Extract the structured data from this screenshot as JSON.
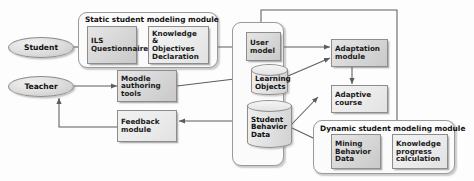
{
  "diagram": {
    "actors": [
      {
        "id": "student",
        "label": "Student"
      },
      {
        "id": "teacher",
        "label": "Teacher"
      }
    ],
    "groups": [
      {
        "id": "static-module",
        "title": "Static student modeling module"
      },
      {
        "id": "dynamic-module",
        "title": "Dynamic student modeling module"
      },
      {
        "id": "data-store-group",
        "title": ""
      }
    ],
    "boxes": [
      {
        "id": "ils-questionnaire",
        "lines": [
          "ILS",
          "Questionnaire"
        ]
      },
      {
        "id": "knowledge-objectives-declaration",
        "lines": [
          "Knowledge &",
          "Objectives",
          "Declaration"
        ]
      },
      {
        "id": "moodle-authoring-tools",
        "lines": [
          "Moodle",
          "authoring tools"
        ]
      },
      {
        "id": "feedback-module",
        "lines": [
          "Feedback",
          "module"
        ]
      },
      {
        "id": "user-model",
        "lines": [
          "User",
          "model"
        ]
      },
      {
        "id": "adaptation-module",
        "lines": [
          "Adaptation",
          "module"
        ]
      },
      {
        "id": "adaptive-course",
        "lines": [
          "Adaptive",
          "course"
        ]
      },
      {
        "id": "mining-behavior-data",
        "lines": [
          "Mining",
          "Behavior",
          "Data"
        ]
      },
      {
        "id": "knowledge-progress-calculation",
        "lines": [
          "Knowledge",
          "progress",
          "calculation"
        ]
      }
    ],
    "datastores": [
      {
        "id": "learning-objects",
        "lines": [
          "Learning",
          "Objects"
        ]
      },
      {
        "id": "student-behavior-data",
        "lines": [
          "Student",
          "Behavior",
          "Data"
        ]
      }
    ],
    "colors": {
      "box_fill": "#d9d9d9",
      "box_stroke": "#8d8d8d",
      "group_fill": "#fbfbfb",
      "edge_stroke": "#5d5d5d",
      "text": "#1a1a1a",
      "page_background": "#fdfdfd"
    },
    "edges": [
      {
        "from": "student",
        "to": "ils-questionnaire"
      },
      {
        "from": "ils-questionnaire",
        "to": "knowledge-objectives-declaration"
      },
      {
        "from": "knowledge-objectives-declaration",
        "to": "user-model"
      },
      {
        "from": "teacher",
        "to": "moodle-authoring-tools"
      },
      {
        "from": "moodle-authoring-tools",
        "to": "learning-objects"
      },
      {
        "from": "moodle-authoring-tools",
        "to": "student-behavior-data"
      },
      {
        "from": "feedback-module",
        "to": "teacher"
      },
      {
        "from": "dynamic-module",
        "to": "feedback-module"
      },
      {
        "from": "user-model",
        "to": "adaptation-module"
      },
      {
        "from": "learning-objects",
        "to": "adaptation-module"
      },
      {
        "from": "adaptation-module",
        "to": "adaptive-course"
      },
      {
        "from": "student-behavior-data",
        "to": "adaptive-course"
      },
      {
        "from": "student-behavior-data",
        "to": "mining-behavior-data"
      },
      {
        "from": "dynamic-module",
        "to": "user-model"
      }
    ]
  }
}
